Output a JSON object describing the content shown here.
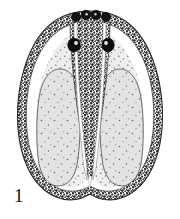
{
  "figure": {
    "label": "1",
    "caption_text": "",
    "background_color": "#ffffff",
    "ink_color": "#1a1a1a",
    "stipple_dark_color": "#3a3a3a",
    "stipple_light_color": "#d8d8d8",
    "outline_color": "#2b2b2b",
    "orientation": "apex-up"
  },
  "anatomy": {
    "body_outline": {
      "name": "body-outline",
      "shape": "pear-heart",
      "width_px": 136,
      "height_px": 192,
      "apex_y": 12,
      "base_y": 202,
      "widest_y": 120,
      "base_notch": "shallow-median-notch"
    },
    "margin_band": {
      "name": "dark-stippled-margin",
      "texture": "coarse-stipple",
      "color": "#3a3a3a",
      "thickness_px": 9
    },
    "inner_bodies": [
      {
        "name": "left-pale-oval",
        "side": "left",
        "center_x": 58,
        "center_y": 128,
        "width_px": 46,
        "height_px": 118,
        "fill": "#dcdcdc",
        "texture": "fine-stipple"
      },
      {
        "name": "right-pale-oval",
        "side": "right",
        "center_x": 122,
        "center_y": 128,
        "width_px": 46,
        "height_px": 118,
        "fill": "#dcdcdc",
        "texture": "fine-stipple"
      }
    ],
    "central_wedge": {
      "name": "median-dark-wedge",
      "shape": "inverted-V",
      "apex_top_y": 20,
      "tip_bottom_y": 178,
      "top_width_px": 40,
      "fill": "#404040",
      "texture": "coarse-stipple",
      "channels": 2,
      "channel_color": "#ffffff"
    },
    "apical_nodules": [
      {
        "name": "apical-nodule-1",
        "cx": 76,
        "cy": 17,
        "r": 4.6
      },
      {
        "name": "apical-nodule-2",
        "cx": 86,
        "cy": 15,
        "r": 4.8
      },
      {
        "name": "apical-nodule-3",
        "cx": 96,
        "cy": 15,
        "r": 4.8
      },
      {
        "name": "apical-nodule-4",
        "cx": 106,
        "cy": 17,
        "r": 4.6
      }
    ],
    "ocelli": [
      {
        "name": "left-ocellus",
        "cx": 74,
        "cy": 45,
        "rx": 6.2,
        "ry": 6.8,
        "color": "#0d0d0d"
      },
      {
        "name": "right-ocellus",
        "cx": 108,
        "cy": 45,
        "rx": 6.2,
        "ry": 6.8,
        "color": "#0d0d0d"
      }
    ]
  }
}
